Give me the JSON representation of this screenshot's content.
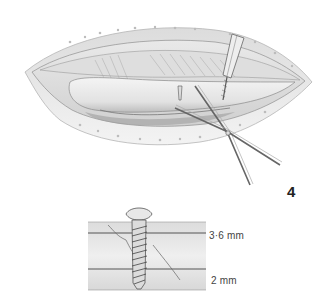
{
  "figure": {
    "number": "4",
    "main_illustration": {
      "subject": "surgical-incision-with-drill-guide-and-forceps",
      "style": "grayscale pencil drawing"
    },
    "inset": {
      "subject": "lag-screw-cross-section-through-bone",
      "labels": {
        "top_hole": "3·6 mm",
        "bottom_hole": "2 mm"
      }
    }
  },
  "colors": {
    "background": "#ffffff",
    "line": "#555555",
    "shade_light": "#e6e6e6",
    "shade_mid": "#c8c8c8",
    "shade_dark": "#8a8a8a",
    "text": "#333333"
  }
}
